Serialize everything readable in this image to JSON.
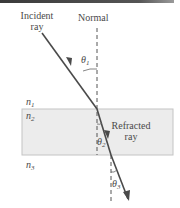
{
  "figure": {
    "type": "refraction-through-slab",
    "labels": {
      "incident": [
        "Incident",
        "ray"
      ],
      "normal": "Normal",
      "refracted": [
        "Refracted",
        "ray"
      ],
      "n1": {
        "symbol": "n",
        "sub": "1"
      },
      "n2": {
        "symbol": "n",
        "sub": "2"
      },
      "n3": {
        "symbol": "n",
        "sub": "3"
      },
      "theta1": {
        "symbol": "θ",
        "sub": "1"
      },
      "theta2": {
        "symbol": "θ",
        "sub": "2"
      },
      "theta3": {
        "symbol": "θ",
        "sub": "3"
      }
    },
    "colors": {
      "ray": "#4a4a4a",
      "slab_fill": "#ececec",
      "slab_border": "#bdbdbd",
      "normal_line": "#555555",
      "text": "#4a4a4a",
      "top_bar": "#3a3a3a"
    }
  }
}
